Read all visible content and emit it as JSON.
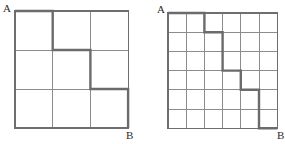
{
  "figure": {
    "background_color": "#ffffff",
    "grid_color": "#8c8c8c",
    "border_color": "#6e6e6e",
    "path_color": "#6b6b6b",
    "label_color": "#2b2b2b",
    "grid_line_width": 1,
    "border_line_width": 1.2,
    "path_line_width": 2.4
  },
  "panels": [
    {
      "id": "left-grid",
      "name": "three-by-three-lattice",
      "columns": 3,
      "rows": 3,
      "origin": {
        "x": 15,
        "y": 11
      },
      "cell_width": 37.7,
      "cell_height": 39,
      "start_label": "A",
      "end_label": "B",
      "start_label_position": {
        "x": 3,
        "y": 3
      },
      "end_label_position": {
        "x": 126,
        "y": 130
      },
      "path_nodes": [
        {
          "col": 0,
          "row": 0
        },
        {
          "col": 1,
          "row": 0
        },
        {
          "col": 1,
          "row": 1
        },
        {
          "col": 2,
          "row": 1
        },
        {
          "col": 2,
          "row": 2
        },
        {
          "col": 3,
          "row": 2
        },
        {
          "col": 3,
          "row": 3
        }
      ],
      "path_moves": [
        "R",
        "D",
        "R",
        "D",
        "R",
        "D"
      ]
    },
    {
      "id": "right-grid",
      "name": "six-by-six-lattice",
      "columns": 6,
      "rows": 6,
      "origin": {
        "x": 168,
        "y": 13
      },
      "cell_width": 18.2,
      "cell_height": 19.2,
      "start_label": "A",
      "end_label": "B",
      "start_label_position": {
        "x": 157,
        "y": 4
      },
      "end_label_position": {
        "x": 277,
        "y": 130
      },
      "path_nodes": [
        {
          "col": 0,
          "row": 0
        },
        {
          "col": 2,
          "row": 0
        },
        {
          "col": 2,
          "row": 1
        },
        {
          "col": 3,
          "row": 1
        },
        {
          "col": 3,
          "row": 3
        },
        {
          "col": 4,
          "row": 3
        },
        {
          "col": 4,
          "row": 4
        },
        {
          "col": 5,
          "row": 4
        },
        {
          "col": 5,
          "row": 6
        },
        {
          "col": 6,
          "row": 6
        }
      ],
      "path_moves": [
        "R",
        "R",
        "D",
        "R",
        "D",
        "D",
        "R",
        "D",
        "R",
        "D",
        "D"
      ]
    }
  ]
}
